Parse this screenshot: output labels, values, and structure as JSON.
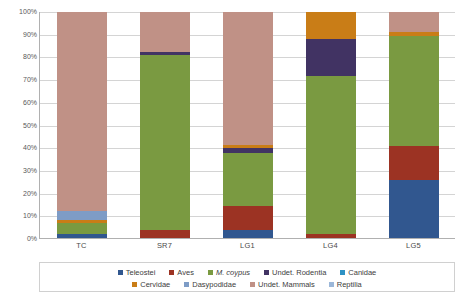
{
  "chart_data": {
    "type": "bar",
    "subtype": "stacked-percentage",
    "title": "",
    "xlabel": "",
    "ylabel": "",
    "ylim": [
      0,
      100
    ],
    "grid": true,
    "legend_position": "bottom",
    "categories": [
      "TC",
      "SR7",
      "LG1",
      "LG4",
      "LG5"
    ],
    "ytick_labels": [
      "0%",
      "10%",
      "20%",
      "30%",
      "40%",
      "50%",
      "60%",
      "70%",
      "80%",
      "90%",
      "100%"
    ],
    "ytick_values": [
      0,
      10,
      20,
      30,
      40,
      50,
      60,
      70,
      80,
      90,
      100
    ],
    "series": [
      {
        "name": "Teleostei",
        "color": "#31578f",
        "values": [
          2.0,
          0.0,
          4.0,
          0.0,
          26.0
        ]
      },
      {
        "name": "Aves",
        "color": "#9c3323",
        "values": [
          0.0,
          4.0,
          10.5,
          2.0,
          15.0
        ]
      },
      {
        "name": "M. coypus",
        "color": "#7a9a41",
        "values": [
          5.0,
          77.0,
          23.5,
          70.0,
          48.5
        ]
      },
      {
        "name": "Undet. Rodentia",
        "color": "#413363",
        "values": [
          0.0,
          1.5,
          2.0,
          16.0,
          0.0
        ]
      },
      {
        "name": "Canidae",
        "color": "#2e92c4",
        "values": [
          0.0,
          0.0,
          0.0,
          0.0,
          0.0
        ]
      },
      {
        "name": "Cervidae",
        "color": "#c97d17",
        "values": [
          1.5,
          0.0,
          1.5,
          12.0,
          1.5
        ]
      },
      {
        "name": "Dasypodidae",
        "color": "#7e9cc6",
        "values": [
          4.0,
          0.0,
          0.0,
          0.0,
          0.0
        ]
      },
      {
        "name": "Undet. Mammals",
        "color": "#c09186",
        "values": [
          87.5,
          17.5,
          58.5,
          0.0,
          9.0
        ]
      },
      {
        "name": "Reptilia",
        "color": "#9bb7d9",
        "values": [
          0.0,
          0.0,
          0.0,
          0.0,
          0.0
        ]
      }
    ],
    "legend_entries": [
      {
        "label": "Teleostei",
        "color": "#31578f",
        "italic": false
      },
      {
        "label": "Aves",
        "color": "#9c3323",
        "italic": false
      },
      {
        "label": "M. coypus",
        "color": "#7a9a41",
        "italic": true
      },
      {
        "label": "Undet. Rodentia",
        "color": "#413363",
        "italic": false
      },
      {
        "label": "Canidae",
        "color": "#2e92c4",
        "italic": false
      },
      {
        "label": "Cervidae",
        "color": "#c97d17",
        "italic": false
      },
      {
        "label": "Dasypodidae",
        "color": "#7e9cc6",
        "italic": false
      },
      {
        "label": "Undet. Mammals",
        "color": "#c09186",
        "italic": false
      },
      {
        "label": "Reptilia",
        "color": "#9bb7d9",
        "italic": false
      }
    ],
    "legend_row_split": 5
  }
}
